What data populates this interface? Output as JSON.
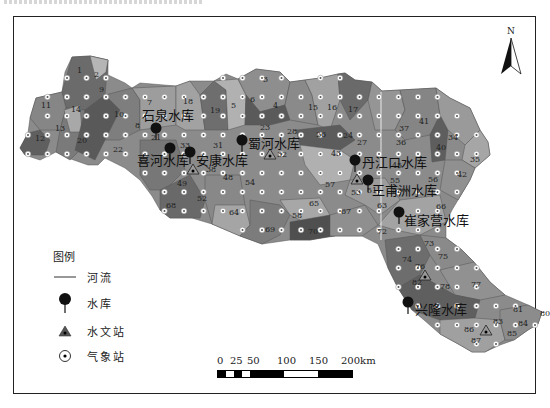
{
  "map": {
    "north_label": "N",
    "reservoirs": [
      {
        "name": "石泉水库",
        "x": 156,
        "y": 128,
        "lx": 142,
        "ly": 120
      },
      {
        "name": "喜河水库",
        "x": 170,
        "y": 148,
        "lx": 137,
        "ly": 165
      },
      {
        "name": "安康水库",
        "x": 190,
        "y": 152,
        "lx": 196,
        "ly": 165
      },
      {
        "name": "蜀河水库",
        "x": 242,
        "y": 140,
        "lx": 248,
        "ly": 148
      },
      {
        "name": "丹江口水库",
        "x": 355,
        "y": 160,
        "lx": 362,
        "ly": 167
      },
      {
        "name": "王甫洲水库",
        "x": 368,
        "y": 180,
        "lx": 372,
        "ly": 195
      },
      {
        "name": "崔家营水库",
        "x": 399,
        "y": 212,
        "lx": 404,
        "ly": 225
      },
      {
        "name": "兴隆水库",
        "x": 408,
        "y": 302,
        "lx": 415,
        "ly": 314
      }
    ],
    "hydro_stations": [
      {
        "x": 193,
        "y": 170
      },
      {
        "x": 270,
        "y": 155
      },
      {
        "x": 357,
        "y": 180
      },
      {
        "x": 425,
        "y": 276
      },
      {
        "x": 486,
        "y": 331
      }
    ],
    "subbasins": [
      {
        "id": "1",
        "x": 77,
        "y": 73
      },
      {
        "id": "2",
        "x": 94,
        "y": 77
      },
      {
        "id": "3",
        "x": 263,
        "y": 82
      },
      {
        "id": "4",
        "x": 273,
        "y": 108
      },
      {
        "id": "5",
        "x": 231,
        "y": 108
      },
      {
        "id": "6",
        "x": 250,
        "y": 102
      },
      {
        "id": "7",
        "x": 147,
        "y": 105
      },
      {
        "id": "8",
        "x": 135,
        "y": 128
      },
      {
        "id": "9",
        "x": 99,
        "y": 92
      },
      {
        "id": "10",
        "x": 114,
        "y": 117
      },
      {
        "id": "11",
        "x": 41,
        "y": 108
      },
      {
        "id": "12",
        "x": 35,
        "y": 141
      },
      {
        "id": "13",
        "x": 55,
        "y": 131
      },
      {
        "id": "14",
        "x": 71,
        "y": 112
      },
      {
        "id": "15",
        "x": 308,
        "y": 110
      },
      {
        "id": "16",
        "x": 327,
        "y": 110
      },
      {
        "id": "17",
        "x": 348,
        "y": 112
      },
      {
        "id": "18",
        "x": 183,
        "y": 104
      },
      {
        "id": "19",
        "x": 210,
        "y": 113
      },
      {
        "id": "20",
        "x": 77,
        "y": 143
      },
      {
        "id": "21",
        "x": 151,
        "y": 140
      },
      {
        "id": "22",
        "x": 113,
        "y": 152
      },
      {
        "id": "23",
        "x": 260,
        "y": 130
      },
      {
        "id": "24",
        "x": 343,
        "y": 138
      },
      {
        "id": "26",
        "x": 316,
        "y": 137
      },
      {
        "id": "27",
        "x": 357,
        "y": 145
      },
      {
        "id": "28",
        "x": 287,
        "y": 134
      },
      {
        "id": "31",
        "x": 213,
        "y": 148
      },
      {
        "id": "32",
        "x": 277,
        "y": 157
      },
      {
        "id": "33",
        "x": 180,
        "y": 148
      },
      {
        "id": "34",
        "x": 448,
        "y": 140
      },
      {
        "id": "35",
        "x": 470,
        "y": 162
      },
      {
        "id": "36",
        "x": 396,
        "y": 145
      },
      {
        "id": "37",
        "x": 399,
        "y": 131
      },
      {
        "id": "38",
        "x": 206,
        "y": 172
      },
      {
        "id": "40",
        "x": 436,
        "y": 150
      },
      {
        "id": "41",
        "x": 419,
        "y": 124
      },
      {
        "id": "42",
        "x": 457,
        "y": 177
      },
      {
        "id": "43",
        "x": 331,
        "y": 156
      },
      {
        "id": "45",
        "x": 392,
        "y": 168
      },
      {
        "id": "48",
        "x": 223,
        "y": 180
      },
      {
        "id": "49",
        "x": 177,
        "y": 186
      },
      {
        "id": "51",
        "x": 367,
        "y": 193
      },
      {
        "id": "52",
        "x": 197,
        "y": 201
      },
      {
        "id": "53",
        "x": 351,
        "y": 195
      },
      {
        "id": "54",
        "x": 245,
        "y": 185
      },
      {
        "id": "55",
        "x": 390,
        "y": 183
      },
      {
        "id": "56",
        "x": 428,
        "y": 182
      },
      {
        "id": "57",
        "x": 325,
        "y": 187
      },
      {
        "id": "58",
        "x": 292,
        "y": 218
      },
      {
        "id": "59",
        "x": 392,
        "y": 193
      },
      {
        "id": "63",
        "x": 377,
        "y": 208
      },
      {
        "id": "64",
        "x": 229,
        "y": 215
      },
      {
        "id": "65",
        "x": 309,
        "y": 206
      },
      {
        "id": "66",
        "x": 436,
        "y": 209
      },
      {
        "id": "67",
        "x": 341,
        "y": 214
      },
      {
        "id": "68",
        "x": 166,
        "y": 208
      },
      {
        "id": "69",
        "x": 265,
        "y": 232
      },
      {
        "id": "70",
        "x": 308,
        "y": 234
      },
      {
        "id": "72",
        "x": 377,
        "y": 234
      },
      {
        "id": "73",
        "x": 424,
        "y": 246
      },
      {
        "id": "74",
        "x": 402,
        "y": 262
      },
      {
        "id": "75",
        "x": 438,
        "y": 259
      },
      {
        "id": "76",
        "x": 415,
        "y": 269
      },
      {
        "id": "77",
        "x": 471,
        "y": 287
      },
      {
        "id": "78",
        "x": 440,
        "y": 289
      },
      {
        "id": "80",
        "x": 540,
        "y": 316
      },
      {
        "id": "81",
        "x": 513,
        "y": 312
      },
      {
        "id": "82",
        "x": 412,
        "y": 285
      },
      {
        "id": "83",
        "x": 493,
        "y": 324
      },
      {
        "id": "84",
        "x": 518,
        "y": 326
      },
      {
        "id": "85",
        "x": 507,
        "y": 336
      },
      {
        "id": "86",
        "x": 464,
        "y": 332
      },
      {
        "id": "87",
        "x": 471,
        "y": 343
      }
    ]
  },
  "legend": {
    "title": "图例",
    "items": [
      {
        "symbol": "river-line",
        "label": "河流"
      },
      {
        "symbol": "reservoir-pin",
        "label": "水库"
      },
      {
        "symbol": "hydrological-station-triangle",
        "label": "水文站"
      },
      {
        "symbol": "weather-station-circle",
        "label": "气象站"
      }
    ]
  },
  "scale_bar": {
    "ticks": [
      "0",
      "25",
      "50",
      "100",
      "150",
      "200km"
    ]
  },
  "colors": {
    "frame": "#222222",
    "basin_dark": "#5e5e5e",
    "basin_mid": "#7a7a7a",
    "basin_light": "#a3a3a3",
    "basin_lighter": "#bdbdbd",
    "reservoir": "#111111",
    "station_ring": "#ffffff"
  }
}
